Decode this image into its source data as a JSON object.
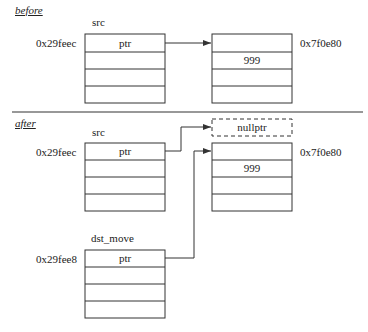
{
  "before": {
    "section_label": "before",
    "src": {
      "name": "src",
      "address": "0x29feec",
      "cells": [
        "ptr",
        "",
        "",
        ""
      ]
    },
    "heap": {
      "address": "0x7f0e80",
      "cells": [
        "",
        "999",
        "",
        ""
      ]
    }
  },
  "after": {
    "section_label": "after",
    "src": {
      "name": "src",
      "address": "0x29feec",
      "cells": [
        "ptr",
        "",
        "",
        ""
      ]
    },
    "nullptr_box": "nullptr",
    "heap": {
      "address": "0x7f0e80",
      "cells": [
        "",
        "999",
        "",
        ""
      ]
    },
    "dst_move": {
      "name": "dst_move",
      "address": "0x29fee8",
      "cells": [
        "ptr",
        "",
        "",
        ""
      ]
    }
  },
  "colors": {
    "line": "#333333",
    "background": "#ffffff"
  }
}
